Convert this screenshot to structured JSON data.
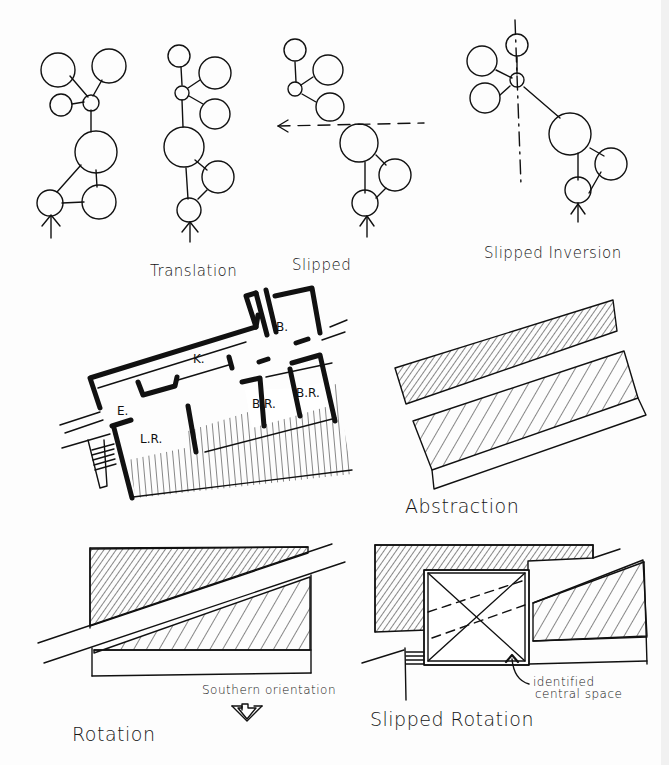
{
  "sheet": {
    "title": "Organizational transformation diagrams",
    "ink_color": "#111111",
    "paper_color": "#fdfdfd"
  },
  "diagrams": {
    "translation": {
      "label": "Translation"
    },
    "slipped": {
      "label": "Slipped"
    },
    "slipped_inversion": {
      "label": "Slipped Inversion"
    },
    "floor_plan": {
      "rooms": [
        "K.",
        "B.",
        "E.",
        "L.R.",
        "B.R.",
        "B.R."
      ]
    },
    "abstraction": {
      "label": "Abstraction"
    },
    "rotation": {
      "label": "Rotation",
      "annotation": "Southern orientation"
    },
    "slipped_rotation": {
      "label": "Slipped Rotation",
      "annotation_line1": "identified",
      "annotation_line2": "central space"
    }
  }
}
